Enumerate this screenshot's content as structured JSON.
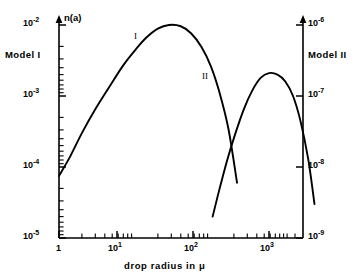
{
  "figure": {
    "background_color": "#ffffff",
    "ink_color": "#000000"
  },
  "axes": {
    "y_left": {
      "title": "n(a)",
      "tick_labels": [
        "10",
        "10",
        "10",
        "10"
      ],
      "tick_exponents": [
        "-2",
        "-3",
        "-4",
        "-5"
      ],
      "model_label": "Model I"
    },
    "y_right": {
      "tick_labels": [
        "10",
        "10",
        "10",
        "10"
      ],
      "tick_exponents": [
        "-6",
        "-7",
        "-8",
        "-9"
      ],
      "model_label": "Model II"
    },
    "x": {
      "title": "drop radius in μ",
      "tick_labels": [
        "1",
        "10",
        "10",
        "10"
      ],
      "tick_exponents": [
        "",
        "1",
        "2",
        "3"
      ]
    }
  },
  "curve_tags": {
    "curve_1": "I",
    "curve_2": "II"
  },
  "chart_data": {
    "type": "line",
    "title": "",
    "subtitle": "",
    "xlabel": "drop radius in μ",
    "ylabel": "n(a)",
    "xscale": "log",
    "yscale": "log",
    "xlim": [
      1,
      3000
    ],
    "ylim_left": [
      1e-05,
      0.01
    ],
    "ylim_right": [
      1e-09,
      1e-06
    ],
    "xticks": [
      1,
      10,
      100,
      1000
    ],
    "xticklabels": [
      "1",
      "10¹",
      "10²",
      "10³"
    ],
    "yticks_left": [
      1e-05,
      0.0001,
      0.001,
      0.01
    ],
    "yticklabels_left": [
      "10⁻⁵",
      "10⁻⁴",
      "10⁻³",
      "10⁻²"
    ],
    "yticks_right": [
      1e-09,
      1e-08,
      1e-07,
      1e-06
    ],
    "yticklabels_right": [
      "10⁻⁹",
      "10⁻⁸",
      "10⁻⁷",
      "10⁻⁶"
    ],
    "grid": false,
    "legend": "inline-annotation",
    "series": [
      {
        "name": "I",
        "axis": "left",
        "annotation": "I",
        "x": [
          1.0,
          1.4,
          2.0,
          3.0,
          4.5,
          7.0,
          10.0,
          14.0,
          20.0,
          28.0,
          40.0,
          55.0,
          75.0,
          100.0,
          130.0,
          170.0,
          220.0
        ],
        "y": [
          7.5e-05,
          0.00014,
          0.0003,
          0.00065,
          0.0013,
          0.0027,
          0.0044,
          0.0066,
          0.0089,
          0.01,
          0.0096,
          0.0076,
          0.0049,
          0.0026,
          0.0011,
          0.00034,
          6e-05
        ]
      },
      {
        "name": "II",
        "axis": "right",
        "annotation": "II",
        "x": [
          105.0,
          130.0,
          165.0,
          210.0,
          270.0,
          350.0,
          450.0,
          580.0,
          750.0,
          950.0,
          1200.0,
          1500.0,
          1900.0,
          2300.0
        ],
        "y": [
          2e-09,
          5e-09,
          1.3e-08,
          3e-08,
          6.5e-08,
          1.2e-07,
          1.8e-07,
          2.1e-07,
          2e-07,
          1.6e-07,
          1e-07,
          4.5e-08,
          1.3e-08,
          3e-09
        ]
      }
    ]
  }
}
